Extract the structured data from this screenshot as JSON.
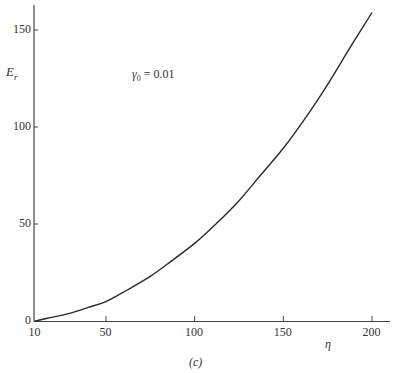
{
  "chart_data": {
    "type": "line",
    "title": "",
    "annotation": "γ0 = 0.01",
    "annotation_parts": {
      "symbol": "γ",
      "subscript": "0",
      "rest": " = 0.01"
    },
    "caption": "(c)",
    "xlabel": "η",
    "ylabel": "E_r",
    "ylabel_parts": {
      "main": "E",
      "subscript": "r"
    },
    "x_ticks": [
      10,
      50,
      100,
      150,
      200
    ],
    "y_ticks": [
      0,
      50,
      100,
      150
    ],
    "xlim": [
      10,
      210
    ],
    "ylim": [
      0,
      165
    ],
    "grid": false,
    "legend": null,
    "series": [
      {
        "name": "γ0 = 0.01",
        "x": [
          10,
          20,
          30,
          40,
          50,
          62,
          75,
          87,
          100,
          112,
          125,
          137,
          150,
          162,
          175,
          187,
          200
        ],
        "y": [
          0,
          2,
          4,
          7,
          10,
          16,
          23,
          31,
          40,
          50,
          62,
          75,
          89,
          104,
          122,
          140,
          159
        ]
      }
    ]
  }
}
